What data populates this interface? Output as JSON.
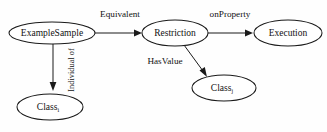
{
  "diagram": {
    "background_color": "#fefefe",
    "stroke_color": "#1a1a1a",
    "text_color": "#111111",
    "nodes": [
      {
        "id": "example-sample",
        "label": "ExampleSample",
        "subscript": "",
        "cx": 52,
        "cy": 33,
        "rx": 43,
        "ry": 11
      },
      {
        "id": "class-i",
        "label": "Class",
        "subscript": "i",
        "cx": 50,
        "cy": 107,
        "rx": 33,
        "ry": 13
      },
      {
        "id": "restriction",
        "label": "Restriction",
        "subscript": "",
        "cx": 175,
        "cy": 33,
        "rx": 33,
        "ry": 13
      },
      {
        "id": "class-j",
        "label": "Class",
        "subscript": "j",
        "cx": 224,
        "cy": 88,
        "rx": 32,
        "ry": 13
      },
      {
        "id": "execution",
        "label": "Execution",
        "subscript": "",
        "cx": 288,
        "cy": 33,
        "rx": 34,
        "ry": 13
      }
    ],
    "edges": [
      {
        "id": "equivalent",
        "label": "Equivalent",
        "from": "example-sample",
        "to": "restriction",
        "label_x": 120,
        "label_y": 15,
        "orientation": "horizontal"
      },
      {
        "id": "individual-of",
        "label": "Individual of",
        "from": "example-sample",
        "to": "class-i",
        "label_x": 72,
        "label_y": 70,
        "orientation": "vertical"
      },
      {
        "id": "on-property",
        "label": "onProperty",
        "from": "restriction",
        "to": "execution",
        "label_x": 230,
        "label_y": 15,
        "orientation": "horizontal"
      },
      {
        "id": "has-value",
        "label": "HasValue",
        "from": "restriction",
        "to": "class-j",
        "label_x": 165,
        "label_y": 62,
        "orientation": "diagonal"
      }
    ]
  }
}
